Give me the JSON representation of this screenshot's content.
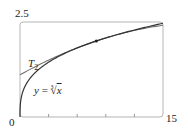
{
  "chart_data": {
    "type": "line",
    "title": "",
    "xlabel": "",
    "ylabel": "",
    "xlim": [
      0,
      15
    ],
    "ylim": [
      0,
      2.5
    ],
    "x_tick_labels": [
      "0",
      "15"
    ],
    "y_tick_labels": [
      "2.5"
    ],
    "x_minor_ticks": [
      3,
      6,
      9,
      12
    ],
    "grid": false,
    "legend": "none (inline labels)",
    "series": [
      {
        "name": "y = ∛x",
        "function": "x^(1/3)",
        "x": [
          0,
          0.125,
          0.5,
          1,
          2,
          3,
          4,
          5,
          6,
          7,
          8,
          9,
          10,
          11,
          12,
          13,
          14,
          15
        ],
        "values": [
          0,
          0.5,
          0.794,
          1,
          1.26,
          1.442,
          1.587,
          1.71,
          1.817,
          1.913,
          2,
          2.08,
          2.154,
          2.224,
          2.289,
          2.351,
          2.41,
          2.466
        ]
      },
      {
        "name": "T₂",
        "function": "2 + (x-8)/12 - (x-8)^2/288",
        "x": [
          0,
          3,
          6,
          8,
          10,
          12,
          15
        ],
        "values": [
          1.111,
          1.497,
          1.819,
          2,
          2.153,
          2.278,
          2.413
        ]
      }
    ],
    "annotations": [
      {
        "text": "T₂",
        "near": "tangent curve, left"
      },
      {
        "text": "y = ∛x",
        "near": "cube root curve, lower left"
      },
      {
        "type": "point",
        "x": 8,
        "y": 2,
        "label": "point of tangency"
      }
    ],
    "colors": {
      "curve": "#333333",
      "taylor": "#777777",
      "frame": "#aaaaaa"
    }
  },
  "labels": {
    "y_max": "2.5",
    "x_min": "0",
    "x_max": "15",
    "t2_main": "T",
    "t2_sub": "2",
    "curve_y": "y",
    "curve_eq": " = ",
    "curve_root_index": "3",
    "curve_radical": "√",
    "curve_x": "x"
  }
}
